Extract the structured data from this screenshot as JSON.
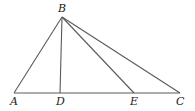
{
  "diagram": {
    "type": "geometry-triangle",
    "points": {
      "A": {
        "x": 14,
        "y": 93,
        "label": "A",
        "lx": 10,
        "ly": 105
      },
      "B": {
        "x": 62,
        "y": 17,
        "label": "B",
        "lx": 58,
        "ly": 12
      },
      "C": {
        "x": 180,
        "y": 93,
        "label": "C",
        "lx": 176,
        "ly": 105
      },
      "D": {
        "x": 60,
        "y": 93,
        "label": "D",
        "lx": 56,
        "ly": 105
      },
      "E": {
        "x": 134,
        "y": 93,
        "label": "E",
        "lx": 130,
        "ly": 105
      }
    },
    "segments": [
      [
        "A",
        "C"
      ],
      [
        "B",
        "A"
      ],
      [
        "B",
        "D"
      ],
      [
        "B",
        "E"
      ],
      [
        "B",
        "C"
      ]
    ],
    "colors": {
      "line": "#5a5a5a",
      "label": "#222222"
    }
  }
}
